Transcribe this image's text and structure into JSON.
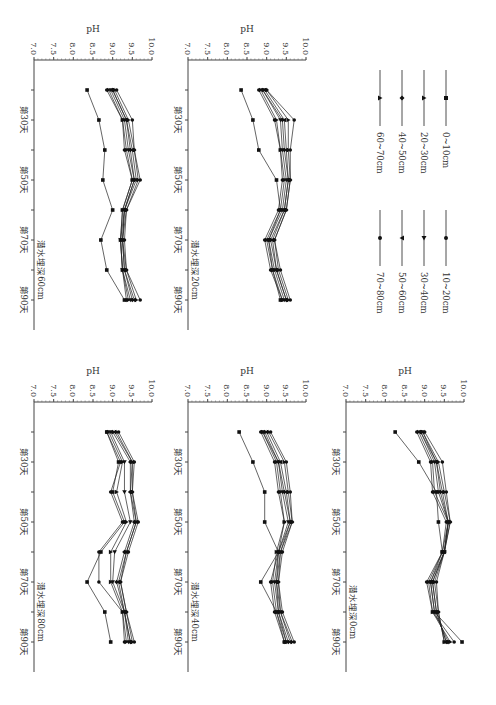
{
  "figure": {
    "ylabel": "pH",
    "yticks": [
      "10.0",
      "9.5",
      "9.0",
      "8.5",
      "8.0",
      "7.5",
      "7.0"
    ],
    "xtick_labels": [
      "第30天",
      "第50天",
      "第70天",
      "第90天"
    ]
  },
  "legend": {
    "items": [
      {
        "label": "0~10cm",
        "marker": "square"
      },
      {
        "label": "10~20cm",
        "marker": "circle"
      },
      {
        "label": "20~30cm",
        "marker": "triangle-up"
      },
      {
        "label": "30~40cm",
        "marker": "triangle-right"
      },
      {
        "label": "40~50cm",
        "marker": "diamond"
      },
      {
        "label": "50~60cm",
        "marker": "triangle-down"
      },
      {
        "label": "60~70cm",
        "marker": "triangle-up"
      },
      {
        "label": "70~80cm",
        "marker": "circle"
      }
    ]
  },
  "chart_data": [
    {
      "type": "line",
      "title": "潜水埋深0cm",
      "xlabel": "",
      "ylabel": "pH",
      "ylim": [
        7.0,
        10.0
      ],
      "x": [
        20,
        30,
        40,
        50,
        60,
        70,
        80,
        90
      ],
      "x_tick_labels": {
        "30": "第30天",
        "50": "第50天",
        "70": "第70天",
        "90": "第90天"
      },
      "series": [
        {
          "name": "0~10cm",
          "values": [
            8.25,
            8.85,
            9.3,
            9.35,
            9.45,
            9.15,
            9.25,
            9.95
          ]
        },
        {
          "name": "10~20cm",
          "values": [
            8.8,
            9.15,
            9.2,
            9.55,
            9.45,
            9.05,
            9.2,
            9.75
          ]
        },
        {
          "name": "20~30cm",
          "values": [
            8.85,
            9.2,
            9.25,
            9.6,
            9.45,
            9.1,
            9.2,
            9.65
          ]
        },
        {
          "name": "30~40cm",
          "values": [
            8.9,
            9.25,
            9.35,
            9.6,
            9.5,
            9.15,
            9.25,
            9.6
          ]
        },
        {
          "name": "40~50cm",
          "values": [
            8.9,
            9.3,
            9.4,
            9.6,
            9.5,
            9.2,
            9.3,
            9.55
          ]
        },
        {
          "name": "50~60cm",
          "values": [
            8.95,
            9.3,
            9.45,
            9.6,
            9.5,
            9.2,
            9.3,
            9.55
          ]
        },
        {
          "name": "60~70cm",
          "values": [
            8.95,
            9.35,
            9.5,
            9.65,
            9.5,
            9.25,
            9.35,
            9.5
          ]
        },
        {
          "name": "70~80cm",
          "values": [
            9.0,
            9.45,
            9.55,
            9.65,
            9.5,
            9.3,
            9.35,
            9.5
          ]
        }
      ]
    },
    {
      "type": "line",
      "title": "潜水埋深20cm",
      "xlabel": "",
      "ylabel": "pH",
      "ylim": [
        7.0,
        10.0
      ],
      "x": [
        20,
        30,
        40,
        50,
        60,
        70,
        80,
        90
      ],
      "x_tick_labels": {
        "30": "第30天",
        "50": "第50天",
        "70": "第70天",
        "90": "第90天"
      },
      "series": [
        {
          "name": "0~10cm",
          "values": [
            8.35,
            8.65,
            8.8,
            9.25,
            9.35,
            9.05,
            9.15,
            9.35
          ]
        },
        {
          "name": "10~20cm",
          "values": [
            8.8,
            9.2,
            9.35,
            9.4,
            9.3,
            8.95,
            9.1,
            9.4
          ]
        },
        {
          "name": "20~30cm",
          "values": [
            8.85,
            9.25,
            9.35,
            9.45,
            9.35,
            9.0,
            9.15,
            9.4
          ]
        },
        {
          "name": "30~40cm",
          "values": [
            8.9,
            9.35,
            9.4,
            9.5,
            9.4,
            9.05,
            9.2,
            9.45
          ]
        },
        {
          "name": "40~50cm",
          "values": [
            8.9,
            9.4,
            9.45,
            9.55,
            9.45,
            9.1,
            9.25,
            9.5
          ]
        },
        {
          "name": "50~60cm",
          "values": [
            8.95,
            9.45,
            9.5,
            9.55,
            9.45,
            9.15,
            9.25,
            9.5
          ]
        },
        {
          "name": "60~70cm",
          "values": [
            9.0,
            9.55,
            9.55,
            9.6,
            9.5,
            9.2,
            9.3,
            9.55
          ]
        },
        {
          "name": "70~80cm",
          "values": [
            9.0,
            9.7,
            9.6,
            9.6,
            9.5,
            9.2,
            9.35,
            9.6
          ]
        }
      ]
    },
    {
      "type": "line",
      "title": "潜水埋深40cm",
      "xlabel": "",
      "ylabel": "pH",
      "ylim": [
        7.0,
        10.0
      ],
      "x": [
        20,
        30,
        40,
        50,
        60,
        70,
        80,
        90
      ],
      "x_tick_labels": {
        "30": "第30天",
        "50": "第50天",
        "70": "第70天",
        "90": "第90天"
      },
      "series": [
        {
          "name": "0~10cm",
          "values": [
            8.3,
            8.65,
            8.95,
            8.95,
            9.3,
            8.85,
            9.25,
            9.45
          ]
        },
        {
          "name": "10~20cm",
          "values": [
            8.85,
            9.2,
            9.3,
            9.45,
            9.3,
            9.1,
            9.2,
            9.45
          ]
        },
        {
          "name": "20~30cm",
          "values": [
            8.9,
            9.25,
            9.35,
            9.45,
            9.25,
            9.15,
            9.25,
            9.5
          ]
        },
        {
          "name": "30~40cm",
          "values": [
            8.9,
            9.3,
            9.4,
            9.55,
            9.3,
            9.2,
            9.3,
            9.5
          ]
        },
        {
          "name": "40~50cm",
          "values": [
            8.95,
            9.3,
            9.45,
            9.6,
            9.3,
            9.25,
            9.3,
            9.55
          ]
        },
        {
          "name": "50~60cm",
          "values": [
            9.0,
            9.35,
            9.5,
            9.6,
            9.35,
            9.25,
            9.35,
            9.6
          ]
        },
        {
          "name": "60~70cm",
          "values": [
            9.05,
            9.45,
            9.55,
            9.65,
            9.35,
            9.3,
            9.35,
            9.65
          ]
        },
        {
          "name": "70~80cm",
          "values": [
            9.1,
            9.5,
            9.6,
            9.65,
            9.4,
            9.3,
            9.4,
            9.7
          ]
        }
      ]
    },
    {
      "type": "line",
      "title": "潜水埋深60cm",
      "xlabel": "",
      "ylabel": "pH",
      "ylim": [
        7.0,
        10.0
      ],
      "x": [
        20,
        30,
        40,
        50,
        60,
        70,
        80,
        90
      ],
      "x_tick_labels": {
        "30": "第30天",
        "50": "第50天",
        "70": "第70天",
        "90": "第90天"
      },
      "series": [
        {
          "name": "0~10cm",
          "values": [
            8.35,
            8.65,
            8.8,
            8.75,
            9.0,
            8.7,
            8.85,
            9.3
          ]
        },
        {
          "name": "10~20cm",
          "values": [
            8.85,
            9.25,
            9.3,
            9.5,
            9.25,
            9.2,
            9.25,
            9.35
          ]
        },
        {
          "name": "20~30cm",
          "values": [
            8.9,
            9.25,
            9.35,
            9.5,
            9.25,
            9.2,
            9.25,
            9.4
          ]
        },
        {
          "name": "30~40cm",
          "values": [
            8.95,
            9.3,
            9.4,
            9.55,
            9.3,
            9.2,
            9.25,
            9.45
          ]
        },
        {
          "name": "40~50cm",
          "values": [
            9.0,
            9.35,
            9.45,
            9.55,
            9.3,
            9.25,
            9.3,
            9.5
          ]
        },
        {
          "name": "50~60cm",
          "values": [
            9.0,
            9.35,
            9.5,
            9.6,
            9.3,
            9.25,
            9.3,
            9.55
          ]
        },
        {
          "name": "60~70cm",
          "values": [
            9.05,
            9.4,
            9.55,
            9.65,
            9.35,
            9.25,
            9.35,
            9.6
          ]
        },
        {
          "name": "70~80cm",
          "values": [
            9.1,
            9.5,
            9.55,
            9.7,
            9.35,
            9.3,
            9.35,
            9.7
          ]
        }
      ]
    },
    {
      "type": "line",
      "title": "潜水埋深80cm",
      "xlabel": "",
      "ylabel": "pH",
      "ylim": [
        7.0,
        10.0
      ],
      "x": [
        20,
        30,
        40,
        50,
        60,
        70,
        80,
        90
      ],
      "x_tick_labels": {
        "30": "第30天",
        "50": "第50天",
        "70": "第70天",
        "90": "第90天"
      },
      "series": [
        {
          "name": "0~10cm",
          "values": [
            8.85,
            9.15,
            9.0,
            9.3,
            8.7,
            8.35,
            8.8,
            8.95
          ]
        },
        {
          "name": "10~20cm",
          "values": [
            8.85,
            9.2,
            8.95,
            9.25,
            8.65,
            8.65,
            9.25,
            9.3
          ]
        },
        {
          "name": "20~30cm",
          "values": [
            8.9,
            9.25,
            9.1,
            9.35,
            8.95,
            8.95,
            9.25,
            9.35
          ]
        },
        {
          "name": "30~40cm",
          "values": [
            8.95,
            9.3,
            9.3,
            9.45,
            9.05,
            9.0,
            9.3,
            9.4
          ]
        },
        {
          "name": "40~50cm",
          "values": [
            9.0,
            9.45,
            9.45,
            9.55,
            9.3,
            9.1,
            9.3,
            9.45
          ]
        },
        {
          "name": "50~60cm",
          "values": [
            9.05,
            9.5,
            9.45,
            9.6,
            9.35,
            9.15,
            9.3,
            9.45
          ]
        },
        {
          "name": "60~70cm",
          "values": [
            9.1,
            9.5,
            9.5,
            9.6,
            9.35,
            9.2,
            9.35,
            9.5
          ]
        },
        {
          "name": "70~80cm",
          "values": [
            9.15,
            9.55,
            9.5,
            9.65,
            9.4,
            9.2,
            9.35,
            9.55
          ]
        }
      ]
    }
  ]
}
